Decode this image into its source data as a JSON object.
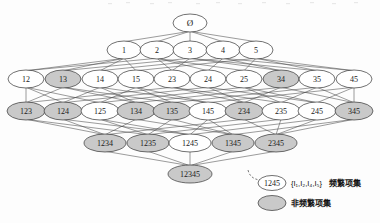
{
  "figure": {
    "background": "#fdfdfd",
    "frequent_fill": "#ffffff",
    "infrequent_fill": "#c9c9c9",
    "edge_color": "#4a4a4a",
    "node_stroke": "#333333"
  },
  "chart_data": {
    "type": "diagram",
    "subtype": "itemset-lattice",
    "levels": [
      {
        "level": 0,
        "y": 23,
        "nodes": [
          {
            "label": "Ø",
            "x": 190,
            "rx": 17,
            "ry": 9,
            "state": "frequent",
            "font": 9
          }
        ]
      },
      {
        "level": 1,
        "y": 50,
        "nodes": [
          {
            "label": "1",
            "x": 124,
            "rx": 17,
            "ry": 9,
            "state": "frequent",
            "font": 8
          },
          {
            "label": "2",
            "x": 157,
            "rx": 17,
            "ry": 9,
            "state": "frequent",
            "font": 8
          },
          {
            "label": "3",
            "x": 190,
            "rx": 17,
            "ry": 9,
            "state": "frequent",
            "font": 8
          },
          {
            "label": "4",
            "x": 223,
            "rx": 17,
            "ry": 9,
            "state": "frequent",
            "font": 8
          },
          {
            "label": "5",
            "x": 256,
            "rx": 17,
            "ry": 9,
            "state": "frequent",
            "font": 8
          }
        ]
      },
      {
        "level": 2,
        "y": 79,
        "nodes": [
          {
            "label": "12",
            "x": 26,
            "rx": 18,
            "ry": 9,
            "state": "frequent",
            "font": 8
          },
          {
            "label": "13",
            "x": 63,
            "rx": 18,
            "ry": 9,
            "state": "infrequent",
            "font": 8
          },
          {
            "label": "14",
            "x": 100,
            "rx": 18,
            "ry": 9,
            "state": "frequent",
            "font": 8
          },
          {
            "label": "15",
            "x": 136,
            "rx": 18,
            "ry": 9,
            "state": "frequent",
            "font": 8
          },
          {
            "label": "23",
            "x": 172,
            "rx": 18,
            "ry": 9,
            "state": "frequent",
            "font": 8
          },
          {
            "label": "24",
            "x": 208,
            "rx": 18,
            "ry": 9,
            "state": "frequent",
            "font": 8
          },
          {
            "label": "25",
            "x": 244,
            "rx": 18,
            "ry": 9,
            "state": "frequent",
            "font": 8
          },
          {
            "label": "34",
            "x": 281,
            "rx": 18,
            "ry": 9,
            "state": "infrequent",
            "font": 8
          },
          {
            "label": "35",
            "x": 317,
            "rx": 18,
            "ry": 9,
            "state": "frequent",
            "font": 8
          },
          {
            "label": "45",
            "x": 354,
            "rx": 18,
            "ry": 9,
            "state": "frequent",
            "font": 8
          }
        ]
      },
      {
        "level": 3,
        "y": 111,
        "nodes": [
          {
            "label": "123",
            "x": 26,
            "rx": 19,
            "ry": 9,
            "state": "infrequent",
            "font": 8
          },
          {
            "label": "124",
            "x": 63,
            "rx": 19,
            "ry": 9,
            "state": "infrequent",
            "font": 8
          },
          {
            "label": "125",
            "x": 100,
            "rx": 19,
            "ry": 9,
            "state": "frequent",
            "font": 8
          },
          {
            "label": "134",
            "x": 136,
            "rx": 19,
            "ry": 9,
            "state": "infrequent",
            "font": 8
          },
          {
            "label": "135",
            "x": 172,
            "rx": 19,
            "ry": 9,
            "state": "infrequent",
            "font": 8
          },
          {
            "label": "145",
            "x": 208,
            "rx": 19,
            "ry": 9,
            "state": "frequent",
            "font": 8
          },
          {
            "label": "234",
            "x": 244,
            "rx": 19,
            "ry": 9,
            "state": "infrequent",
            "font": 8
          },
          {
            "label": "235",
            "x": 281,
            "rx": 19,
            "ry": 9,
            "state": "frequent",
            "font": 8
          },
          {
            "label": "245",
            "x": 317,
            "rx": 19,
            "ry": 9,
            "state": "frequent",
            "font": 8
          },
          {
            "label": "345",
            "x": 354,
            "rx": 19,
            "ry": 9,
            "state": "infrequent",
            "font": 8
          }
        ]
      },
      {
        "level": 4,
        "y": 143,
        "nodes": [
          {
            "label": "1234",
            "x": 105,
            "rx": 21,
            "ry": 9,
            "state": "infrequent",
            "font": 8
          },
          {
            "label": "1235",
            "x": 148,
            "rx": 21,
            "ry": 9,
            "state": "infrequent",
            "font": 8
          },
          {
            "label": "1245",
            "x": 190,
            "rx": 21,
            "ry": 9,
            "state": "frequent",
            "font": 8
          },
          {
            "label": "1345",
            "x": 233,
            "rx": 21,
            "ry": 9,
            "state": "infrequent",
            "font": 8
          },
          {
            "label": "2345",
            "x": 276,
            "rx": 21,
            "ry": 9,
            "state": "infrequent",
            "font": 8
          }
        ]
      },
      {
        "level": 5,
        "y": 174,
        "nodes": [
          {
            "label": "12345",
            "x": 190,
            "rx": 22,
            "ry": 9,
            "state": "infrequent",
            "font": 8
          }
        ]
      }
    ],
    "edges": [
      [
        "Ø",
        "1"
      ],
      [
        "Ø",
        "2"
      ],
      [
        "Ø",
        "3"
      ],
      [
        "Ø",
        "4"
      ],
      [
        "Ø",
        "5"
      ],
      [
        "1",
        "12"
      ],
      [
        "1",
        "13"
      ],
      [
        "1",
        "14"
      ],
      [
        "1",
        "15"
      ],
      [
        "2",
        "12"
      ],
      [
        "2",
        "23"
      ],
      [
        "2",
        "24"
      ],
      [
        "2",
        "25"
      ],
      [
        "3",
        "13"
      ],
      [
        "3",
        "23"
      ],
      [
        "3",
        "34"
      ],
      [
        "3",
        "35"
      ],
      [
        "4",
        "14"
      ],
      [
        "4",
        "24"
      ],
      [
        "4",
        "34"
      ],
      [
        "4",
        "45"
      ],
      [
        "5",
        "15"
      ],
      [
        "5",
        "25"
      ],
      [
        "5",
        "35"
      ],
      [
        "5",
        "45"
      ],
      [
        "12",
        "123"
      ],
      [
        "12",
        "124"
      ],
      [
        "12",
        "125"
      ],
      [
        "13",
        "123"
      ],
      [
        "13",
        "134"
      ],
      [
        "13",
        "135"
      ],
      [
        "14",
        "124"
      ],
      [
        "14",
        "134"
      ],
      [
        "14",
        "145"
      ],
      [
        "15",
        "125"
      ],
      [
        "15",
        "135"
      ],
      [
        "15",
        "145"
      ],
      [
        "23",
        "123"
      ],
      [
        "23",
        "234"
      ],
      [
        "23",
        "235"
      ],
      [
        "24",
        "124"
      ],
      [
        "24",
        "234"
      ],
      [
        "24",
        "245"
      ],
      [
        "25",
        "125"
      ],
      [
        "25",
        "235"
      ],
      [
        "25",
        "245"
      ],
      [
        "34",
        "134"
      ],
      [
        "34",
        "234"
      ],
      [
        "34",
        "345"
      ],
      [
        "35",
        "135"
      ],
      [
        "35",
        "235"
      ],
      [
        "35",
        "345"
      ],
      [
        "45",
        "145"
      ],
      [
        "45",
        "245"
      ],
      [
        "45",
        "345"
      ],
      [
        "123",
        "1234"
      ],
      [
        "123",
        "1235"
      ],
      [
        "124",
        "1234"
      ],
      [
        "124",
        "1245"
      ],
      [
        "125",
        "1235"
      ],
      [
        "125",
        "1245"
      ],
      [
        "134",
        "1234"
      ],
      [
        "134",
        "1345"
      ],
      [
        "135",
        "1235"
      ],
      [
        "135",
        "1345"
      ],
      [
        "145",
        "1245"
      ],
      [
        "145",
        "1345"
      ],
      [
        "234",
        "1234"
      ],
      [
        "234",
        "2345"
      ],
      [
        "235",
        "1235"
      ],
      [
        "235",
        "2345"
      ],
      [
        "245",
        "1245"
      ],
      [
        "245",
        "2345"
      ],
      [
        "345",
        "1345"
      ],
      [
        "345",
        "2345"
      ],
      [
        "1234",
        "12345"
      ],
      [
        "1235",
        "12345"
      ],
      [
        "1245",
        "12345"
      ],
      [
        "1345",
        "12345"
      ],
      [
        "2345",
        "12345"
      ]
    ],
    "legend": {
      "position": "bottom-right",
      "items": [
        {
          "sample_label": "1245",
          "state": "frequent",
          "set_notation": "{I₁,I₂,I₄,I₅}",
          "description": "频繁项集",
          "x": 272,
          "y": 183
        },
        {
          "sample_label": "",
          "state": "infrequent",
          "set_notation": "",
          "description": "非频繁项集",
          "x": 272,
          "y": 203
        }
      ],
      "pointer": {
        "style": "dashed-arc",
        "from_x": 248,
        "from_y": 170,
        "to_x": 268,
        "to_y": 180
      }
    }
  }
}
